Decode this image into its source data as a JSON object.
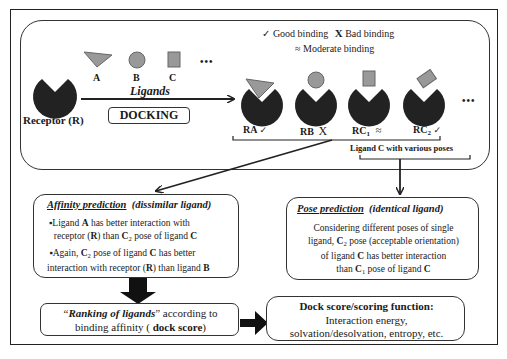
{
  "colors": {
    "receptor": "#222222",
    "ligand": "#999999",
    "ligand_stroke": "#666666",
    "border": "#333333"
  },
  "legend": {
    "good_symbol": "✓",
    "good_label": "Good binding",
    "bad_symbol": "X",
    "bad_label": "Bad binding",
    "moderate_symbol": "≈",
    "moderate_label": "Moderate binding"
  },
  "ligands": {
    "items": [
      {
        "shape": "triangle",
        "label": "A"
      },
      {
        "shape": "circle",
        "label": "B"
      },
      {
        "shape": "square",
        "label": "C"
      }
    ],
    "ellipsis": "•••",
    "caption": "Ligands"
  },
  "receptor": {
    "label": "Receptor (R)"
  },
  "docking": {
    "label": "DOCKING"
  },
  "complexes": [
    {
      "label": "RA",
      "sub": "",
      "symbol": "✓"
    },
    {
      "label": "RB",
      "sub": "",
      "symbol": "X"
    },
    {
      "label": "RC",
      "sub": "1",
      "symbol": "≈"
    },
    {
      "label": "RC",
      "sub": "2",
      "symbol": "✓"
    }
  ],
  "complexes_ellipsis": "•••",
  "poses_caption": "Ligand C with various poses",
  "affinity": {
    "title": "Affinity prediction",
    "subtitle": "(dissimilar ligand)",
    "bullets": [
      {
        "pre": "▪Ligand ",
        "b1": "A",
        "mid1": " has better interaction with",
        "line2pre": "receptor (",
        "b2": "R",
        "line2mid": ") than ",
        "b3": "C",
        "sub": "2",
        "line2end": " pose of ligand ",
        "b4": "C"
      },
      {
        "pre": "▪Again, ",
        "b1": "C",
        "sub": "2",
        "mid1": " pose of ligand ",
        "b2": "C",
        "mid2": " has better",
        "line2pre": "interaction with receptor (",
        "b3": "R",
        "line2mid": ") than ligand ",
        "b4": "B"
      }
    ]
  },
  "pose": {
    "title": "Pose prediction",
    "subtitle": "(identical ligand)",
    "l1": "Considering different poses of single",
    "l2pre": "ligand, ",
    "l2b": "C",
    "l2sub": "2",
    "l2end": " pose (acceptable orientation)",
    "l3pre": "of ligand ",
    "l3b": "C",
    "l3end": " has better interaction",
    "l4pre": "than ",
    "l4b": "C",
    "l4sub": "1",
    "l4mid": " pose of ligand ",
    "l4b2": "C"
  },
  "ranking": {
    "q_open": "“",
    "title": "Ranking of ligands",
    "q_close": "”",
    "rest1": " according to",
    "l2pre": "binding affinity ( ",
    "l2b": "dock score",
    "l2end": ")"
  },
  "dockscore": {
    "title": "Dock score/scoring function:",
    "l1": "Interaction energy,",
    "l2": "solvation/desolvation, entropy, etc."
  }
}
